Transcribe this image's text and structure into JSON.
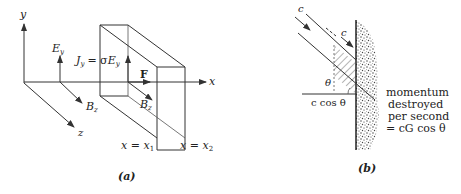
{
  "panel_a": {
    "caption": "(a)",
    "axes": {
      "x": "x",
      "y": "y",
      "z": "z"
    },
    "labels": {
      "E_main": "E",
      "E_sub": "y",
      "B_main": "B",
      "B_sub": "z",
      "B2_main": "B",
      "B2_sub": "z",
      "J_main": "J",
      "J_sub": "y",
      "J_eq": "= σ",
      "J_E": "E",
      "J_E_sub": "y",
      "force": "F",
      "x1_lhs": "x = x",
      "x1_sub": "1",
      "x2_lhs": "x = x",
      "x2_sub": "2"
    }
  },
  "panel_b": {
    "caption": "(b)",
    "labels": {
      "c_incident": "c",
      "c_along": "c",
      "theta": "θ",
      "c_cos_theta": "c cos θ",
      "note_line1": "momentum",
      "note_line2": "destroyed",
      "note_line3": "per second",
      "note_line4": "= cG cos θ"
    }
  }
}
